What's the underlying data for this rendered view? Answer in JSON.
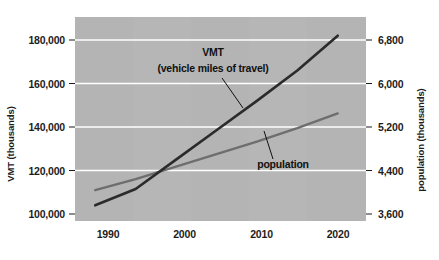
{
  "chart_data": {
    "type": "line",
    "title": "",
    "xlabel": "",
    "ylabel": "VMT (thousands)",
    "y2label": "population (thousands)",
    "grid": true,
    "legend_position": "inline-annotations",
    "background_color": "#b4b4b4",
    "gridline_color": "#ffffff",
    "x": [
      1990,
      1995,
      2000,
      2005,
      2010,
      2015,
      2020
    ],
    "xlim": [
      1987.5,
      2023.5
    ],
    "xticks": [
      1990,
      2000,
      2010,
      2020
    ],
    "xtick_labels": [
      "1990",
      "2000",
      "2010",
      "2020"
    ],
    "ylim": [
      100000,
      190000
    ],
    "yticks": [
      100000,
      120000,
      140000,
      160000,
      180000
    ],
    "ytick_labels": [
      "100,000",
      "120,000",
      "140,000",
      "160,000",
      "180,000"
    ],
    "y2lim": [
      3600,
      7200
    ],
    "y2ticks": [
      3600,
      4400,
      5200,
      6000,
      6800
    ],
    "y2tick_labels": [
      "3,600",
      "4,400",
      "5,200",
      "6,000",
      "6,800"
    ],
    "series": [
      {
        "name": "VMT",
        "label": "VMT",
        "sublabel": "(vehicle miles of travel)",
        "axis": "left",
        "color": "#2b2b2b",
        "width": 2.6,
        "units": "thousands",
        "values": [
          104000,
          111500,
          125000,
          138500,
          152000,
          166000,
          182000
        ]
      },
      {
        "name": "population",
        "label": "population",
        "sublabel": "",
        "axis": "right",
        "color": "#6e6e6e",
        "width": 2.4,
        "units": "thousands",
        "values": [
          4040,
          4240,
          4470,
          4700,
          4930,
          5180,
          5450
        ]
      }
    ],
    "annotations": [
      {
        "text": "VMT",
        "x": 2001.1,
        "y": 173500
      },
      {
        "text": "(vehicle miles of travel)",
        "x": 2001.1,
        "y": 166800
      },
      {
        "text": "population",
        "x": 2009.9,
        "y": 126400
      }
    ]
  }
}
